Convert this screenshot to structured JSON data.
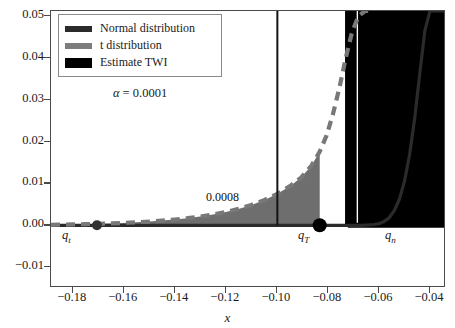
{
  "chart_data": {
    "type": "line",
    "title": "",
    "xlabel": "x",
    "ylabel": "",
    "xlim": [
      -0.1885,
      -0.0345
    ],
    "ylim": [
      -0.0145,
      0.0512
    ],
    "grid": false,
    "xticks": [
      "-0.18",
      "-0.16",
      "-0.14",
      "-0.12",
      "-0.10",
      "-0.08",
      "-0.06",
      "-0.04"
    ],
    "xtick_values": [
      -0.18,
      -0.16,
      -0.14,
      -0.12,
      -0.1,
      -0.08,
      -0.06,
      -0.04
    ],
    "yticks": [
      "-0.01",
      "0.00",
      "0.01",
      "0.02",
      "0.03",
      "0.04",
      "0.05"
    ],
    "ytick_values": [
      -0.01,
      0.0,
      0.01,
      0.02,
      0.03,
      0.04,
      0.05
    ],
    "legend_position": "upper left",
    "annotations": [
      {
        "name": "shaded-area-value",
        "text": "0.0008",
        "x": -0.1075,
        "y": 0.0023
      },
      {
        "name": "alpha-note",
        "text": "α = 0.0001"
      },
      {
        "name": "q-t-label",
        "text": "q",
        "subscript": "t",
        "x": -0.1705,
        "y": -0.0055
      },
      {
        "name": "q-T-label",
        "text": "q",
        "subscript": "T",
        "x": -0.0835,
        "y": -0.0055
      },
      {
        "name": "q-n-label",
        "text": "q",
        "subscript": "n",
        "x": -0.0555,
        "y": -0.0055
      }
    ],
    "markers": [
      {
        "name": "q-t-marker",
        "x": -0.1705,
        "y": 0.0,
        "size": 5,
        "color": "#333333"
      },
      {
        "name": "q-T-marker",
        "x": -0.0832,
        "y": 0.0,
        "size": 7,
        "color": "#000000"
      }
    ],
    "vlines": [
      {
        "name": "threshold-line",
        "x": -0.0998,
        "color": "#141414",
        "width": 2.0
      }
    ],
    "series": [
      {
        "name": "Normal distribution",
        "style": "solid",
        "color": "#2b2b2b",
        "x": [
          -0.1885,
          -0.17,
          -0.16,
          -0.15,
          -0.14,
          -0.13,
          -0.12,
          -0.11,
          -0.1,
          -0.09,
          -0.085,
          -0.08,
          -0.075,
          -0.07,
          -0.067,
          -0.064,
          -0.062,
          -0.06,
          -0.058,
          -0.056,
          -0.054,
          -0.052,
          -0.05,
          -0.048,
          -0.046,
          -0.044,
          -0.042,
          -0.04,
          -0.038,
          -0.036,
          -0.0345
        ],
        "y": [
          0.0,
          0.0,
          0.0,
          0.0,
          0.0,
          0.0,
          0.0,
          0.0,
          0.0,
          0.0,
          0.0,
          0.0,
          0.0,
          0.0,
          0.0,
          0.0001,
          0.0002,
          0.0004,
          0.0009,
          0.0018,
          0.0035,
          0.0062,
          0.0105,
          0.0168,
          0.0255,
          0.0362,
          0.0465,
          0.0512,
          0.0512,
          0.0512,
          0.0512
        ]
      },
      {
        "name": "t distribution",
        "style": "dashed",
        "color": "#787878",
        "x": [
          -0.1885,
          -0.18,
          -0.175,
          -0.17,
          -0.165,
          -0.16,
          -0.155,
          -0.15,
          -0.145,
          -0.14,
          -0.135,
          -0.13,
          -0.125,
          -0.12,
          -0.115,
          -0.11,
          -0.105,
          -0.1,
          -0.095,
          -0.0905,
          -0.0865,
          -0.0832,
          -0.0805,
          -0.078,
          -0.0755,
          -0.073,
          -0.0705,
          -0.068,
          -0.0655,
          -0.0635
        ],
        "y": [
          0.00012,
          0.00021,
          0.00028,
          0.00036,
          0.00046,
          0.00058,
          0.00072,
          0.0009,
          0.00112,
          0.00138,
          0.0017,
          0.0021,
          0.00258,
          0.00318,
          0.00392,
          0.00485,
          0.006,
          0.00745,
          0.0093,
          0.0114,
          0.0142,
          0.0176,
          0.0215,
          0.0266,
          0.0328,
          0.04,
          0.0462,
          0.05,
          0.0512,
          0.0512
        ]
      },
      {
        "name": "Estimate TWI",
        "style": "vertical-lines",
        "color": "#000000",
        "x": [
          -0.0722,
          -0.0716,
          -0.0705,
          -0.0698,
          -0.0674,
          -0.0665,
          -0.0651,
          -0.064,
          -0.0629,
          -0.0618,
          -0.0606,
          -0.0596,
          -0.0585,
          -0.0574,
          -0.0562,
          -0.0551,
          -0.054,
          -0.0529,
          -0.0518,
          -0.0507,
          -0.0496,
          -0.0485,
          -0.0473,
          -0.0462,
          -0.0451,
          -0.044,
          -0.0429,
          -0.0418,
          -0.0407,
          -0.0396,
          -0.0385,
          -0.0374,
          -0.0363,
          -0.0352
        ]
      }
    ],
    "shaded_region": {
      "name": "t-distribution-tail-fill",
      "color": "#6e6e6e",
      "x_from": -0.1885,
      "x_to": -0.0832,
      "value_label": "0.0008"
    }
  },
  "legend": {
    "items": [
      {
        "label": "Normal distribution",
        "swatch": "normal-line-swatch"
      },
      {
        "label": "t distribution",
        "swatch": "t-line-swatch"
      },
      {
        "label": "Estimate TWI",
        "swatch": "twi-bar-swatch"
      }
    ]
  },
  "alpha": {
    "text": "α = 0.0001",
    "symbol": "α",
    "equals": "=",
    "value": "0.0001"
  },
  "axis": {
    "x_label": "x",
    "x_ticks": [
      "-0.18",
      "-0.16",
      "-0.14",
      "-0.12",
      "-0.10",
      "-0.08",
      "-0.06",
      "-0.04"
    ],
    "y_ticks": [
      "0.05",
      "0.04",
      "0.03",
      "0.02",
      "0.01",
      "0.00",
      "-0.01"
    ]
  },
  "labels": {
    "area_value": "0.0008",
    "q_t": "q",
    "q_t_sub": "t",
    "q_T": "q",
    "q_T_sub": "T",
    "q_n": "q",
    "q_n_sub": "n"
  },
  "colors": {
    "normal": "#2b2b2b",
    "t_dist": "#787878",
    "twi": "#000000",
    "fill": "#6e6e6e",
    "axis": "#4a4a4a",
    "background": "#ffffff"
  }
}
